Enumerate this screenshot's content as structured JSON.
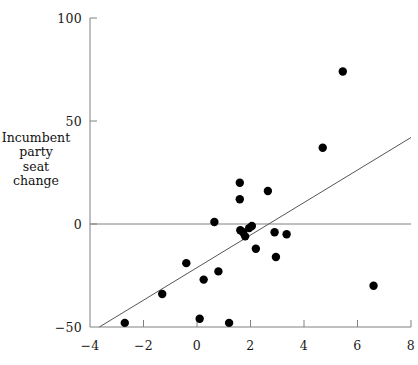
{
  "chart_data": {
    "type": "scatter",
    "title": "",
    "xlabel": "",
    "ylabel": "Incumbent party seat change",
    "ylabel_lines": [
      "Incumbent",
      "party",
      "seat",
      "change"
    ],
    "xlim": [
      -4,
      8
    ],
    "ylim": [
      -50,
      100
    ],
    "xticks": [
      -4,
      -2,
      0,
      2,
      4,
      6,
      8
    ],
    "xtick_labels": [
      "−4",
      "−2",
      "0",
      "2",
      "4",
      "6",
      "8"
    ],
    "yticks": [
      -50,
      0,
      50,
      100
    ],
    "ytick_labels": [
      "−50",
      "0",
      "50",
      "100"
    ],
    "grid": false,
    "zero_line": true,
    "legend": null,
    "marker_color": "#000000",
    "marker_size": 4.2,
    "axis_color": "#808080",
    "points": [
      {
        "x": -2.7,
        "y": -48
      },
      {
        "x": -1.3,
        "y": -34
      },
      {
        "x": -0.4,
        "y": -19
      },
      {
        "x": 0.1,
        "y": -46
      },
      {
        "x": 0.25,
        "y": -27
      },
      {
        "x": 0.65,
        "y": 1
      },
      {
        "x": 0.8,
        "y": -23
      },
      {
        "x": 1.2,
        "y": -48
      },
      {
        "x": 1.6,
        "y": 20
      },
      {
        "x": 1.6,
        "y": 12
      },
      {
        "x": 1.62,
        "y": -3
      },
      {
        "x": 1.72,
        "y": -4
      },
      {
        "x": 1.8,
        "y": -6
      },
      {
        "x": 1.95,
        "y": -2
      },
      {
        "x": 2.05,
        "y": -1
      },
      {
        "x": 2.2,
        "y": -12
      },
      {
        "x": 2.65,
        "y": 16
      },
      {
        "x": 2.9,
        "y": -4
      },
      {
        "x": 2.95,
        "y": -16
      },
      {
        "x": 3.35,
        "y": -5
      },
      {
        "x": 4.7,
        "y": 37
      },
      {
        "x": 5.45,
        "y": 74
      },
      {
        "x": 6.6,
        "y": -30
      }
    ],
    "regression_line": {
      "x_start": -3.65,
      "y_start": -50,
      "x_end": 8.0,
      "y_end": 42,
      "color": "#555555"
    }
  }
}
